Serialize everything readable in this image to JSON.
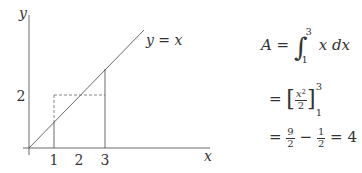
{
  "figure": {
    "axes": {
      "x_label": "x",
      "y_label": "y",
      "x_ticks": [
        "1",
        "2",
        "3"
      ],
      "y_ticks": [
        "2"
      ]
    },
    "curve_label": "y = x",
    "colors": {
      "line": "#444444",
      "dashed": "#555555",
      "text": "#333333"
    }
  },
  "equations": {
    "line1": {
      "lhs": "A =",
      "integral_sign": "∫",
      "upper": "3",
      "lower": "1",
      "integrand": "x dx"
    },
    "line2": {
      "eq": "=",
      "num": "x",
      "num_sup": "2",
      "den": "2",
      "upper": "3",
      "lower": "1"
    },
    "line3": {
      "eq1": "=",
      "a_num": "9",
      "a_den": "2",
      "minus": "−",
      "b_num": "1",
      "b_den": "2",
      "eq2": "=",
      "result": "4"
    }
  }
}
